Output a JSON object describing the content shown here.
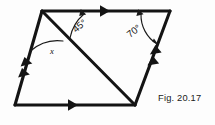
{
  "figure": {
    "caption": "Fig. 20.17",
    "ink_color": "#141414",
    "background_color": "#fdfdfd",
    "shape": "parallelogram-with-diagonal",
    "vertices": {
      "top_left": [
        42,
        11
      ],
      "top_right": [
        170,
        11
      ],
      "bottom_right": [
        135,
        105
      ],
      "bottom_left": [
        15,
        105
      ]
    },
    "diagonal": {
      "from": "top_left",
      "to": "bottom_right",
      "arrowheads": 0
    },
    "edge_marks": [
      {
        "edge": "top",
        "ticks": 1,
        "direction": "right"
      },
      {
        "edge": "bottom",
        "ticks": 1,
        "direction": "right"
      },
      {
        "edge": "left",
        "ticks": 2,
        "direction": "up"
      },
      {
        "edge": "right",
        "ticks": 2,
        "direction": "up"
      }
    ],
    "angles": [
      {
        "name": "angle-45",
        "label": "45°",
        "value": 45,
        "unit": "degrees",
        "vertex": "top_left",
        "between": [
          "top-edge",
          "diagonal"
        ],
        "label_position": [
          76,
          33
        ],
        "label_rotation": -40,
        "arc_arrowheads": 1
      },
      {
        "name": "angle-70",
        "label": "70°",
        "value": 70,
        "unit": "degrees",
        "vertex": "top_right",
        "between": [
          "top-edge",
          "right-edge"
        ],
        "label_position": [
          130,
          38
        ],
        "label_rotation": -38,
        "arc_arrowheads": 2
      },
      {
        "name": "angle-x",
        "label": "x",
        "value": null,
        "unit": "unknown",
        "vertex": "top_left",
        "between": [
          "left-edge",
          "diagonal"
        ],
        "label_position": [
          50,
          52
        ],
        "label_rotation": 0,
        "arc_arrowheads": 0
      }
    ]
  }
}
